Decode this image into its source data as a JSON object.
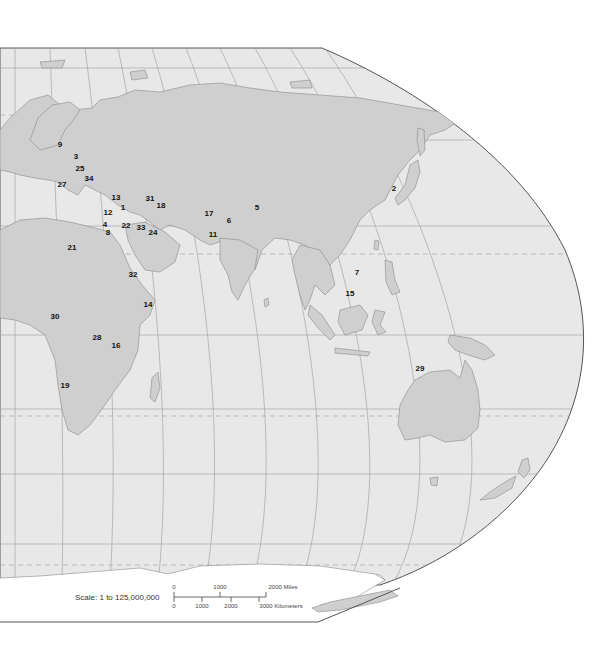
{
  "map": {
    "projection": "Robinson-style world map, eastern hemisphere",
    "colors": {
      "ocean": "#e8e8e8",
      "land": "#cfcfcf",
      "border": "#8a8a8a",
      "outline": "#555555",
      "graticule": "#9a9a9a",
      "antarctica": "#ffffff",
      "background": "#ffffff"
    },
    "markers": [
      {
        "id": "1",
        "x": 123,
        "y": 208
      },
      {
        "id": "2",
        "x": 394,
        "y": 189
      },
      {
        "id": "3",
        "x": 76,
        "y": 157
      },
      {
        "id": "4",
        "x": 105,
        "y": 225
      },
      {
        "id": "5",
        "x": 257,
        "y": 208
      },
      {
        "id": "6",
        "x": 229,
        "y": 221
      },
      {
        "id": "7",
        "x": 357,
        "y": 273
      },
      {
        "id": "8",
        "x": 108,
        "y": 233
      },
      {
        "id": "9",
        "x": 60,
        "y": 145
      },
      {
        "id": "11",
        "x": 213,
        "y": 235
      },
      {
        "id": "12",
        "x": 108,
        "y": 213
      },
      {
        "id": "13",
        "x": 116,
        "y": 198
      },
      {
        "id": "14",
        "x": 148,
        "y": 305
      },
      {
        "id": "15",
        "x": 350,
        "y": 294
      },
      {
        "id": "16",
        "x": 116,
        "y": 346
      },
      {
        "id": "17",
        "x": 209,
        "y": 214
      },
      {
        "id": "18",
        "x": 161,
        "y": 206
      },
      {
        "id": "19",
        "x": 65,
        "y": 386
      },
      {
        "id": "21",
        "x": 72,
        "y": 248
      },
      {
        "id": "22",
        "x": 126,
        "y": 226
      },
      {
        "id": "24",
        "x": 153,
        "y": 233
      },
      {
        "id": "25",
        "x": 80,
        "y": 169
      },
      {
        "id": "27",
        "x": 62,
        "y": 185
      },
      {
        "id": "28",
        "x": 97,
        "y": 338
      },
      {
        "id": "29",
        "x": 420,
        "y": 369
      },
      {
        "id": "30",
        "x": 55,
        "y": 317
      },
      {
        "id": "31",
        "x": 150,
        "y": 199
      },
      {
        "id": "32",
        "x": 133,
        "y": 275
      },
      {
        "id": "33",
        "x": 141,
        "y": 228
      },
      {
        "id": "34",
        "x": 89,
        "y": 179
      }
    ]
  },
  "scale": {
    "label": "Scale:  1 to 125,000,000",
    "miles_ticks": [
      "0",
      "1000",
      "2000 Miles"
    ],
    "km_ticks": [
      "0",
      "1000",
      "2000",
      "3000 Kilometers"
    ]
  }
}
